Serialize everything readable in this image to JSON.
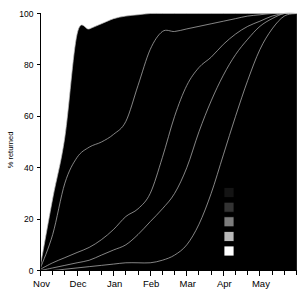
{
  "chart_data": {
    "type": "area",
    "title": "",
    "subtitle": "",
    "xlabel": "",
    "ylabel": "% returned",
    "ylim": [
      0,
      100
    ],
    "yticks": [
      0,
      20,
      40,
      60,
      80,
      100
    ],
    "xticks_major": [
      "Nov",
      "Dec",
      "Jan",
      "Feb",
      "Mar",
      "Apr",
      "May"
    ],
    "x_minor_ticks_per_month": 3,
    "grid": false,
    "stacked": true,
    "legend_position": "inside-bottom-right",
    "note": "Cumulative percentage returned through the season; each band is a stacked cumulative curve, uppermost is Breeders.",
    "x": [
      "Nov",
      "Nov-2",
      "Nov-3",
      "Dec",
      "Dec-2",
      "Dec-3",
      "Jan",
      "Jan-2",
      "Jan-3",
      "Feb",
      "Feb-2",
      "Feb-3",
      "Mar",
      "Mar-2",
      "Mar-3",
      "Apr",
      "Apr-2",
      "Apr-3",
      "May",
      "May-2",
      "May-3",
      "End"
    ],
    "series": [
      {
        "name": "Breeders",
        "color": "#000000",
        "cumulative": [
          2,
          28,
          52,
          92,
          94,
          96,
          98,
          99,
          99.5,
          100,
          100,
          100,
          100,
          100,
          100,
          100,
          100,
          100,
          100,
          100,
          100,
          100
        ]
      },
      {
        "name": "Former breeders",
        "color": "#141414",
        "cumulative": [
          1,
          14,
          34,
          44,
          48,
          50,
          53,
          58,
          72,
          86,
          93,
          93,
          94,
          95,
          96,
          97,
          98,
          99,
          99.5,
          100,
          100,
          100
        ]
      },
      {
        "name": "8-year olds",
        "color": "#333333",
        "cumulative": [
          0.5,
          3,
          5,
          7,
          9,
          12,
          16,
          21,
          24,
          30,
          44,
          60,
          72,
          79,
          83,
          88,
          92,
          95,
          97,
          99,
          100,
          100
        ]
      },
      {
        "name": "7-year olds",
        "color": "#7d7d7d",
        "cumulative": [
          0,
          1,
          2,
          3,
          4,
          6,
          8,
          10,
          14,
          19,
          24,
          30,
          40,
          54,
          66,
          76,
          84,
          90,
          95,
          98,
          100,
          100
        ]
      },
      {
        "name": "5-year olds",
        "color": "#b9b9b9",
        "cumulative": [
          0,
          0,
          0.5,
          1,
          1.5,
          2,
          2.5,
          3,
          3,
          3,
          4,
          6,
          10,
          18,
          30,
          45,
          60,
          74,
          86,
          94,
          99,
          100
        ]
      },
      {
        "name": "2-year olds",
        "color": "#ffffff",
        "cumulative": [
          0,
          0,
          0,
          0,
          0,
          0,
          0,
          0,
          0,
          0,
          0,
          0,
          0,
          0,
          0,
          0,
          0,
          0,
          0,
          0,
          0,
          0
        ]
      }
    ],
    "legend": [
      {
        "label": "Breeders",
        "color": "#000000"
      },
      {
        "label": "Former breeders",
        "color": "#141414"
      },
      {
        "label": "8-year olds",
        "color": "#333333"
      },
      {
        "label": "7-year olds",
        "color": "#7d7d7d"
      },
      {
        "label": "5-year olds",
        "color": "#b9b9b9"
      },
      {
        "label": "2-year olds",
        "color": "#ffffff"
      }
    ]
  }
}
